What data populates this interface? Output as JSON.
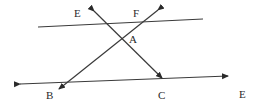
{
  "diagram": {
    "type": "geometry-lines",
    "labels": {
      "E_top": "E",
      "F": "F",
      "A": "A",
      "B": "B",
      "C": "C",
      "E_right": "E"
    },
    "lines": [
      {
        "name": "top-line",
        "from": [
          38,
          27
        ],
        "to": [
          203,
          19
        ],
        "arrows": "none"
      },
      {
        "name": "bottom-line",
        "from": [
          18,
          84
        ],
        "to": [
          228,
          76
        ],
        "arrows": "both"
      },
      {
        "name": "transversal-EC",
        "from": [
          94,
          11
        ],
        "to": [
          162,
          78
        ],
        "arrows": "both"
      },
      {
        "name": "transversal-FB",
        "from": [
          158,
          10
        ],
        "to": [
          58,
          90
        ],
        "arrows": "both"
      }
    ],
    "points": {
      "A": [
        123,
        39
      ],
      "B": [
        58,
        90
      ],
      "C": [
        162,
        78
      ]
    },
    "stroke_color": "#3a3a3a"
  }
}
